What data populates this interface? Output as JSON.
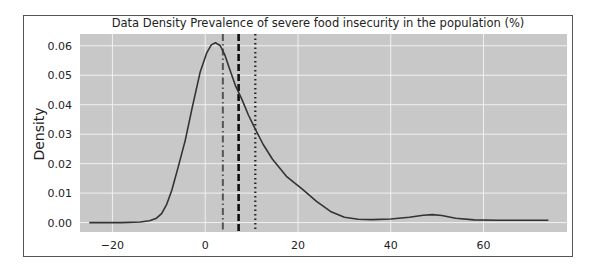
{
  "chart_data": {
    "type": "line",
    "title": "Data Density Prevalence of severe food insecurity in the population (%)",
    "xlabel": "",
    "ylabel": "Density",
    "xlim": [
      -27,
      78
    ],
    "ylim": [
      -0.0032,
      0.064
    ],
    "grid": true,
    "legend": null,
    "x_ticks": [
      -20,
      0,
      20,
      40,
      60
    ],
    "x_tick_labels": [
      "−20",
      "0",
      "20",
      "40",
      "60"
    ],
    "y_ticks": [
      0.0,
      0.01,
      0.02,
      0.03,
      0.04,
      0.05,
      0.06
    ],
    "y_tick_labels": [
      "0.00",
      "0.01",
      "0.02",
      "0.03",
      "0.04",
      "0.05",
      "0.06"
    ],
    "series": [
      {
        "name": "density",
        "x": [
          -25,
          -18,
          -14,
          -12,
          -10.5,
          -9.4,
          -8.3,
          -7.2,
          -5.8,
          -4.3,
          -2.8,
          -1.1,
          0.3,
          1.3,
          2.2,
          3.2,
          4.2,
          5.3,
          6.5,
          7.9,
          9.3,
          10.8,
          12.5,
          14.5,
          17.5,
          21,
          24,
          27,
          30,
          33,
          36,
          40,
          44,
          47,
          49,
          51,
          54,
          58,
          63,
          68,
          74
        ],
        "y": [
          0.0,
          0.0,
          0.0002,
          0.0006,
          0.0015,
          0.003,
          0.0062,
          0.011,
          0.019,
          0.028,
          0.039,
          0.051,
          0.0575,
          0.0603,
          0.061,
          0.0601,
          0.057,
          0.052,
          0.0465,
          0.0418,
          0.0365,
          0.0317,
          0.0265,
          0.0215,
          0.0157,
          0.0113,
          0.0072,
          0.0038,
          0.0018,
          0.0011,
          0.001,
          0.0012,
          0.0018,
          0.0025,
          0.0027,
          0.0024,
          0.0015,
          0.0009,
          0.0008,
          0.0008,
          0.0008
        ]
      }
    ],
    "vertical_lines": [
      {
        "name": "dash-dot line",
        "x": 3.8,
        "style": "dashdot",
        "color": "#555555"
      },
      {
        "name": "dashed line",
        "x": 7.2,
        "style": "dashed",
        "color": "#111111"
      },
      {
        "name": "dotted line",
        "x": 10.8,
        "style": "dotted",
        "color": "#222222"
      }
    ],
    "colors": {
      "plot_background": "#c8c8c8",
      "grid": "#f0f0f0",
      "curve": "#333333"
    }
  }
}
